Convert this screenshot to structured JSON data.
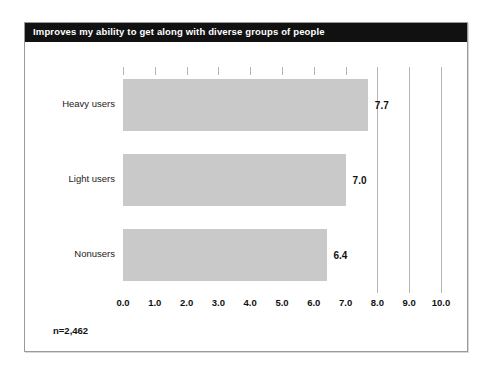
{
  "chart_data": {
    "type": "bar",
    "orientation": "horizontal",
    "title": "Improves my ability to get along with diverse groups of people",
    "categories": [
      "Heavy users",
      "Light users",
      "Nonusers"
    ],
    "values": [
      7.7,
      7.0,
      6.4
    ],
    "data_labels": [
      "7.7",
      "7.0",
      "6.4"
    ],
    "xlabel": "",
    "ylabel": "",
    "xlim": [
      0.0,
      10.0
    ],
    "xticks": [
      0.0,
      1.0,
      2.0,
      3.0,
      4.0,
      5.0,
      6.0,
      7.0,
      8.0,
      9.0,
      10.0
    ],
    "xtick_labels": [
      "0.0",
      "1.0",
      "2.0",
      "3.0",
      "4.0",
      "5.0",
      "6.0",
      "7.0",
      "8.0",
      "9.0",
      "10.0"
    ],
    "grid": true,
    "legend": null,
    "annotation": "n=2,462",
    "colors": {
      "bar_fill": "#c9c9c9",
      "title_bar_bg": "#111111",
      "title_text": "#ffffff",
      "gridline": "#b5b5b5",
      "frame_border": "#9a9a9a",
      "label_text": "#222222"
    }
  },
  "footnote": {
    "sample_size": "n=2,462"
  },
  "header": {
    "title": "Improves my ability to get along with diverse groups of people"
  }
}
